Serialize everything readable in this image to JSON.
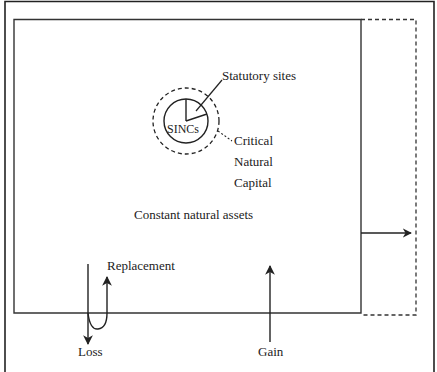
{
  "diagram": {
    "labels": {
      "statutory_sites": "Statutory sites",
      "sincs": "SINCs",
      "critical_natural_capital": [
        "Critical",
        "Natural",
        "Capital"
      ],
      "constant_natural_assets": "Constant natural assets",
      "replacement": "Replacement",
      "loss": "Loss",
      "gain": "Gain"
    },
    "colors": {
      "stroke": "#222222",
      "background": "#ffffff"
    }
  }
}
